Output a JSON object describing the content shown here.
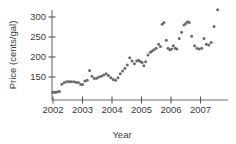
{
  "chart_data": {
    "type": "scatter",
    "title": "",
    "xlabel": "Year",
    "ylabel": "Price (cents/gal)",
    "xlim": [
      2001.92,
      2007.75
    ],
    "ylim": [
      105,
      330
    ],
    "xticks": [
      2002,
      2003,
      2004,
      2005,
      2006,
      2007
    ],
    "xtick_labels": [
      "2002",
      "2003",
      "2004",
      "2005",
      "2006",
      "2007"
    ],
    "yticks": [
      150,
      200,
      250,
      300
    ],
    "ytick_labels": [
      "150",
      "200",
      "250",
      "300"
    ],
    "grid": false,
    "legend": false,
    "marker": "filled-circle",
    "marker_color": "#6b6b6b",
    "axis_color": "#6e6e6e",
    "points": [
      {
        "x": 2002.0,
        "y": 112
      },
      {
        "x": 2002.05,
        "y": 112
      },
      {
        "x": 2002.1,
        "y": 112
      },
      {
        "x": 2002.16,
        "y": 113
      },
      {
        "x": 2002.22,
        "y": 114
      },
      {
        "x": 2002.3,
        "y": 132
      },
      {
        "x": 2002.38,
        "y": 136
      },
      {
        "x": 2002.46,
        "y": 138
      },
      {
        "x": 2002.54,
        "y": 139
      },
      {
        "x": 2002.62,
        "y": 138
      },
      {
        "x": 2002.7,
        "y": 138
      },
      {
        "x": 2002.78,
        "y": 137
      },
      {
        "x": 2002.86,
        "y": 136
      },
      {
        "x": 2002.94,
        "y": 131
      },
      {
        "x": 2003.0,
        "y": 131
      },
      {
        "x": 2003.08,
        "y": 140
      },
      {
        "x": 2003.16,
        "y": 142
      },
      {
        "x": 2003.24,
        "y": 166
      },
      {
        "x": 2003.32,
        "y": 152
      },
      {
        "x": 2003.4,
        "y": 146
      },
      {
        "x": 2003.48,
        "y": 147
      },
      {
        "x": 2003.56,
        "y": 150
      },
      {
        "x": 2003.64,
        "y": 152
      },
      {
        "x": 2003.72,
        "y": 155
      },
      {
        "x": 2003.8,
        "y": 158
      },
      {
        "x": 2003.88,
        "y": 154
      },
      {
        "x": 2003.96,
        "y": 148
      },
      {
        "x": 2004.04,
        "y": 144
      },
      {
        "x": 2004.12,
        "y": 142
      },
      {
        "x": 2004.2,
        "y": 148
      },
      {
        "x": 2004.28,
        "y": 158
      },
      {
        "x": 2004.36,
        "y": 165
      },
      {
        "x": 2004.44,
        "y": 172
      },
      {
        "x": 2004.52,
        "y": 180
      },
      {
        "x": 2004.6,
        "y": 198
      },
      {
        "x": 2004.68,
        "y": 190
      },
      {
        "x": 2004.76,
        "y": 183
      },
      {
        "x": 2004.84,
        "y": 190
      },
      {
        "x": 2004.9,
        "y": 192
      },
      {
        "x": 2004.96,
        "y": 189
      },
      {
        "x": 2005.02,
        "y": 186
      },
      {
        "x": 2005.08,
        "y": 178
      },
      {
        "x": 2005.14,
        "y": 188
      },
      {
        "x": 2005.22,
        "y": 205
      },
      {
        "x": 2005.3,
        "y": 212
      },
      {
        "x": 2005.36,
        "y": 215
      },
      {
        "x": 2005.42,
        "y": 218
      },
      {
        "x": 2005.5,
        "y": 222
      },
      {
        "x": 2005.58,
        "y": 232
      },
      {
        "x": 2005.64,
        "y": 226
      },
      {
        "x": 2005.7,
        "y": 282
      },
      {
        "x": 2005.76,
        "y": 286
      },
      {
        "x": 2005.84,
        "y": 242
      },
      {
        "x": 2005.9,
        "y": 222
      },
      {
        "x": 2005.96,
        "y": 218
      },
      {
        "x": 2006.02,
        "y": 220
      },
      {
        "x": 2006.08,
        "y": 228
      },
      {
        "x": 2006.14,
        "y": 222
      },
      {
        "x": 2006.2,
        "y": 220
      },
      {
        "x": 2006.28,
        "y": 246
      },
      {
        "x": 2006.36,
        "y": 262
      },
      {
        "x": 2006.44,
        "y": 280
      },
      {
        "x": 2006.5,
        "y": 284
      },
      {
        "x": 2006.56,
        "y": 288
      },
      {
        "x": 2006.62,
        "y": 286
      },
      {
        "x": 2006.7,
        "y": 252
      },
      {
        "x": 2006.8,
        "y": 228
      },
      {
        "x": 2006.88,
        "y": 222
      },
      {
        "x": 2006.96,
        "y": 220
      },
      {
        "x": 2007.04,
        "y": 222
      },
      {
        "x": 2007.12,
        "y": 246
      },
      {
        "x": 2007.2,
        "y": 232
      },
      {
        "x": 2007.28,
        "y": 230
      },
      {
        "x": 2007.36,
        "y": 236
      },
      {
        "x": 2007.46,
        "y": 276
      },
      {
        "x": 2007.58,
        "y": 318
      }
    ]
  }
}
